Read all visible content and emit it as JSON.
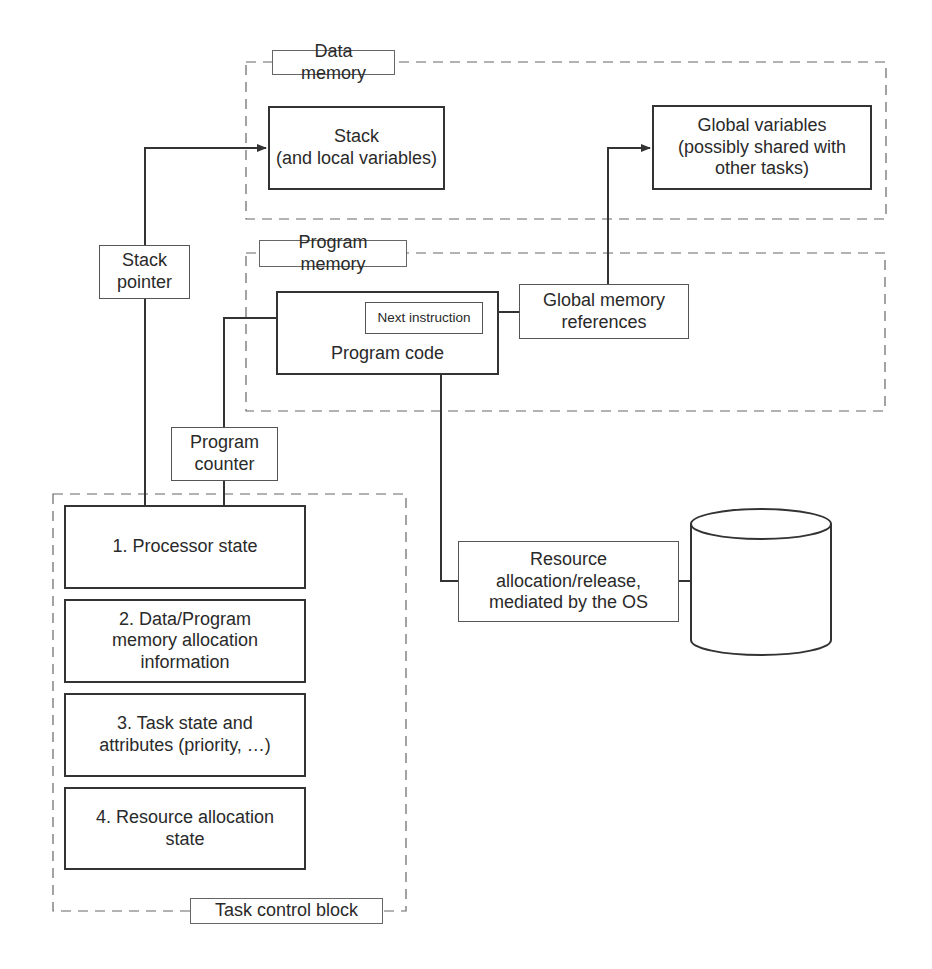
{
  "diagram": {
    "containers": {
      "data_memory": {
        "label": "Data memory"
      },
      "program_memory": {
        "label": "Program memory"
      },
      "task_control_block": {
        "label": "Task control block"
      }
    },
    "nodes": {
      "stack": "Stack\n(and local variables)",
      "global_variables": "Global variables\n(possibly shared with\nother tasks)",
      "program_code": "Program code",
      "next_instruction": "Next instruction",
      "global_memory_references": "Global memory\nreferences",
      "stack_pointer": "Stack\npointer",
      "program_counter": "Program\ncounter",
      "resource_allocation": "Resource\nallocation/release,\nmediated by the OS",
      "resource_store": ""
    },
    "tcb_items": [
      "1. Processor state",
      "2. Data/Program\nmemory allocation\ninformation",
      "3. Task state and\nattributes (priority, …)",
      "4. Resource allocation\nstate"
    ],
    "edges": [
      {
        "from": "stack_pointer",
        "to": "stack",
        "arrow": true
      },
      {
        "from": "program_counter",
        "to": "next_instruction",
        "arrow": true
      },
      {
        "from": "global_memory_references",
        "to": "global_variables",
        "arrow": true
      },
      {
        "from": "program_code",
        "to": "global_memory_references",
        "arrow": false
      },
      {
        "from": "program_code",
        "to": "resource_allocation",
        "arrow": false
      },
      {
        "from": "resource_allocation",
        "to": "resource_store",
        "arrow": false
      },
      {
        "from": "tcb_items.0",
        "to": "stack_pointer",
        "arrow": false
      },
      {
        "from": "tcb_items.0",
        "to": "program_counter",
        "arrow": false
      }
    ],
    "colors": {
      "line": "#333333",
      "dash": "#666666",
      "background": "#ffffff"
    }
  }
}
